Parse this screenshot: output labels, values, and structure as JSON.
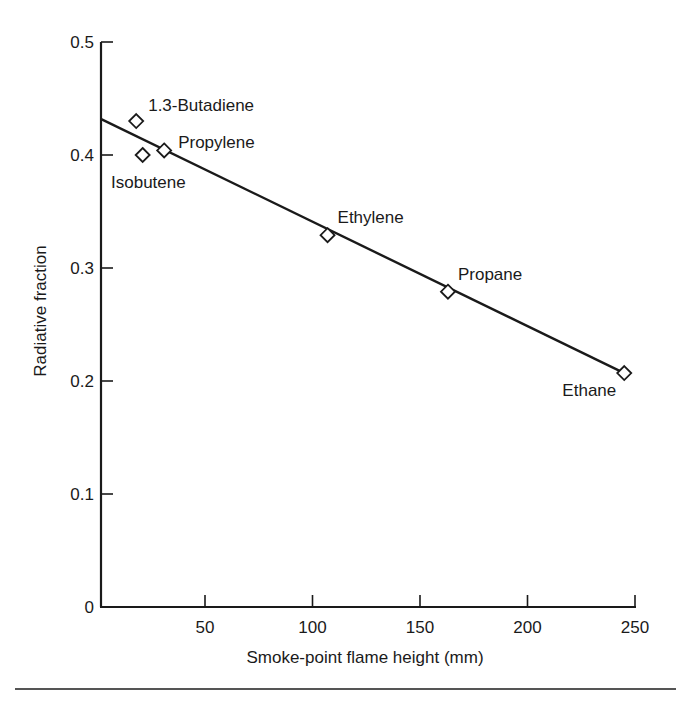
{
  "chart_data": {
    "type": "scatter",
    "title": "",
    "xlabel": "Smoke-point flame height (mm)",
    "ylabel": "Radiative fraction",
    "xlim": [
      0,
      250
    ],
    "ylim": [
      0,
      0.5
    ],
    "grid": false,
    "legend": null,
    "x_ticks": [
      50,
      100,
      150,
      200,
      250
    ],
    "x_tick_labels": [
      "50",
      "100",
      "150",
      "200",
      "250"
    ],
    "y_ticks": [
      0,
      0.1,
      0.2,
      0.3,
      0.4,
      0.5
    ],
    "y_tick_labels": [
      "0",
      "0.1",
      "0.2",
      "0.3",
      "0.4",
      "0.5"
    ],
    "series": [
      {
        "name": "Fuels",
        "marker": "diamond-open",
        "points": [
          {
            "label": "1.3-Butadiene",
            "x": 18,
            "y": 0.43
          },
          {
            "label": "Isobutene",
            "x": 21,
            "y": 0.4
          },
          {
            "label": "Propylene",
            "x": 31,
            "y": 0.404
          },
          {
            "label": "Ethylene",
            "x": 107,
            "y": 0.329
          },
          {
            "label": "Propane",
            "x": 163,
            "y": 0.279
          },
          {
            "label": "Ethane",
            "x": 245,
            "y": 0.207
          }
        ]
      }
    ],
    "fit_line": {
      "name": "Linear fit",
      "x": [
        1.5,
        245
      ],
      "y": [
        0.432,
        0.207
      ]
    },
    "annotations": [
      "1.3-Butadiene",
      "Propylene",
      "Isobutene",
      "Ethylene",
      "Propane",
      "Ethane"
    ]
  },
  "colors": {
    "ink": "#1a1a1a",
    "background": "#ffffff"
  }
}
